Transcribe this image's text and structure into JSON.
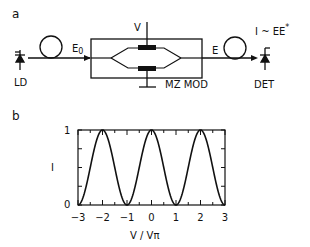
{
  "panel_a": {
    "label": "a",
    "source_label": "LD",
    "field_in_label": "E",
    "field_in_sub": "0",
    "voltage_label": "V",
    "modulator_label": "MZ MOD",
    "field_out_label": "E",
    "detector_equation": "I ~  EE",
    "detector_equation_sup": "*",
    "detector_label": "DET"
  },
  "panel_b": {
    "label": "b"
  },
  "chart_data": {
    "type": "line",
    "title": "",
    "xlabel": "V / Vπ",
    "ylabel": "I",
    "xlim": [
      -3,
      3
    ],
    "ylim": [
      0,
      1
    ],
    "x_ticks": [
      "-3",
      "-2",
      "-1",
      "0",
      "1",
      "2",
      "3"
    ],
    "y_ticks": [
      "0",
      "1"
    ],
    "grid": false,
    "series": [
      {
        "name": "I = cos²(πV/2Vπ)",
        "x": [
          -3,
          -2.5,
          -2,
          -1.5,
          -1,
          -0.5,
          0,
          0.5,
          1,
          1.5,
          2,
          2.5,
          3
        ],
        "values": [
          0,
          0.5,
          1,
          0.5,
          0,
          0.5,
          1,
          0.5,
          0,
          0.5,
          1,
          0.5,
          0
        ]
      }
    ]
  }
}
